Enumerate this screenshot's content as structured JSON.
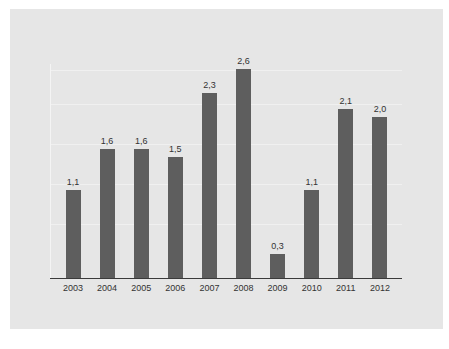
{
  "chart_data": {
    "type": "bar",
    "title": "",
    "xlabel": "",
    "ylabel": "",
    "categories": [
      "2003",
      "2004",
      "2005",
      "2006",
      "2007",
      "2008",
      "2009",
      "2010",
      "2011",
      "2012"
    ],
    "values": [
      1.1,
      1.6,
      1.6,
      1.5,
      2.3,
      2.6,
      0.3,
      1.1,
      2.1,
      2.0
    ],
    "value_labels": [
      "1,1",
      "1,6",
      "1,6",
      "1,5",
      "2,3",
      "2,6",
      "0,3",
      "1,1",
      "2,1",
      "2,0"
    ],
    "ylim": [
      0,
      2.6
    ],
    "grid": true,
    "legend": null,
    "colors": {
      "bar": "#5e5e5e",
      "background": "#e6e6e6",
      "axis": "#3a3a3a"
    }
  }
}
